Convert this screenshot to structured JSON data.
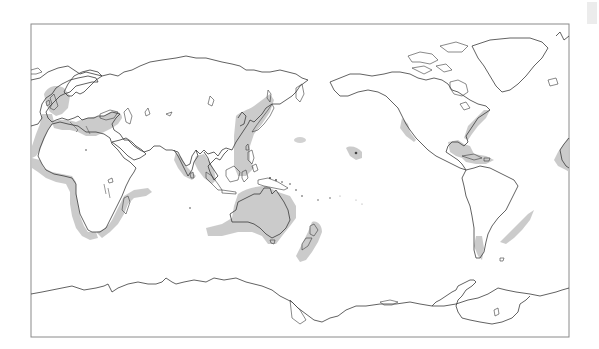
{
  "figure": {
    "type": "world-map",
    "projection": "equirectangular (Pacific-centered)",
    "description": "Outline world map with grey shaded coastal/marine zones",
    "colors": {
      "background": "#ffffff",
      "coastline": "#3a3a3a",
      "frame": "#8a8a8a",
      "shaded_zone": "#c8c8c8"
    }
  },
  "shaded_regions": [
    {
      "name": "Western Europe / British Isles coast"
    },
    {
      "name": "Mediterranean and Black Sea"
    },
    {
      "name": "West African Atlantic coast"
    },
    {
      "name": "Southern Africa and Mozambique Channel"
    },
    {
      "name": "Arabian Sea / Western India coast"
    },
    {
      "name": "Bay of Bengal / Andaman / Malay Peninsula"
    },
    {
      "name": "East Asian coast (Japan, Korea, East China Sea, Philippines)"
    },
    {
      "name": "Australia coastal margins"
    },
    {
      "name": "New Zealand"
    },
    {
      "name": "Hawaiian Islands"
    },
    {
      "name": "Central North Pacific patch"
    },
    {
      "name": "Pacific coast of California / Baja"
    },
    {
      "name": "Gulf of Mexico and Caribbean"
    },
    {
      "name": "US Atlantic coast"
    },
    {
      "name": "Southeast Brazil / Uruguay coast"
    },
    {
      "name": "Chilean coast"
    },
    {
      "name": "Canary Islands / NW Africa (right edge wrap)"
    }
  ],
  "corner_mark": {
    "label": ""
  }
}
